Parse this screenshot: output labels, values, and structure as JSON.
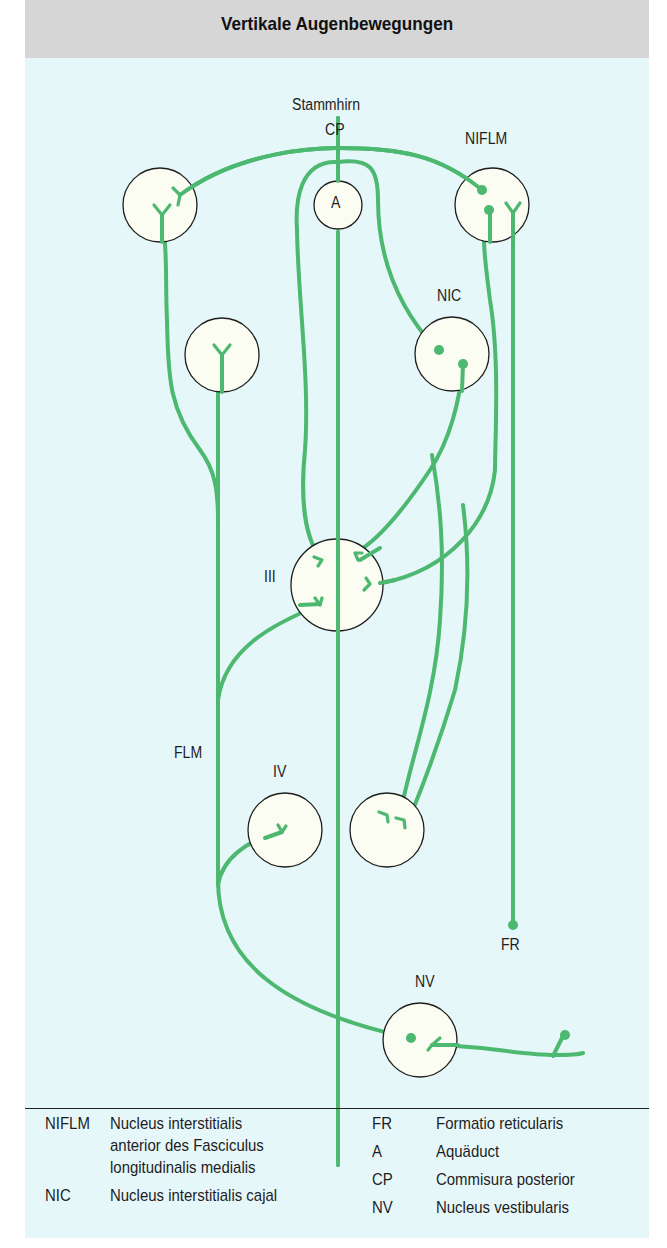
{
  "title": "Vertikale Augenbewegungen",
  "colors": {
    "header_bg": "#d6d6d6",
    "panel_bg": "#e6f7f9",
    "pathway_green": "#4cb870",
    "nucleus_fill": "#fbfdf2",
    "outline": "#1e1e1e"
  },
  "labels": {
    "stammhirn": "Stammhirn",
    "cp": "CP",
    "niflm": "NIFLM",
    "a": "A",
    "nic": "NIC",
    "iii": "III",
    "flm": "FLM",
    "iv": "IV",
    "fr": "FR",
    "nv": "NV"
  },
  "legend": {
    "left": [
      {
        "abbr": "NIFLM",
        "lines": [
          "Nucleus interstitialis",
          "anterior des Fasciculus",
          "longitudinalis medialis"
        ]
      },
      {
        "abbr": "NIC",
        "lines": [
          "Nucleus interstitialis cajal"
        ]
      }
    ],
    "right": [
      {
        "abbr": "FR",
        "text": "Formatio reticularis"
      },
      {
        "abbr": "A",
        "text": "Aquäduct"
      },
      {
        "abbr": "CP",
        "text": "Commisura posterior"
      },
      {
        "abbr": "NV",
        "text": "Nucleus vestibularis"
      }
    ]
  }
}
